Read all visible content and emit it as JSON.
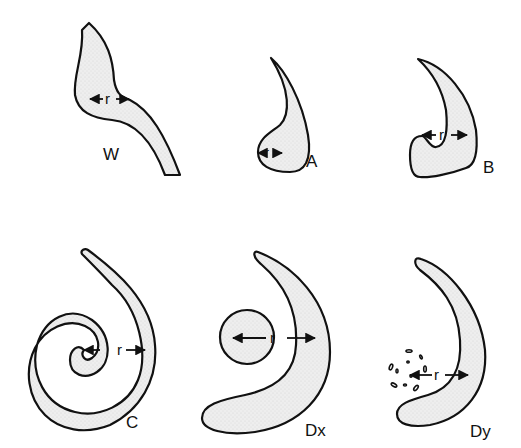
{
  "figure": {
    "panels": [
      {
        "id": "W",
        "label": "W",
        "radius_label": "r"
      },
      {
        "id": "A",
        "label": "A",
        "radius_label": "r"
      },
      {
        "id": "B",
        "label": "B",
        "radius_label": "r"
      },
      {
        "id": "C",
        "label": "C",
        "radius_label": "r"
      },
      {
        "id": "Dx",
        "label": "Dx",
        "radius_label": "r"
      },
      {
        "id": "Dy",
        "label": "Dy",
        "radius_label": "r"
      }
    ],
    "colors": {
      "stroke": "#111111",
      "fill": "#ebebeb",
      "background": "#ffffff"
    }
  }
}
